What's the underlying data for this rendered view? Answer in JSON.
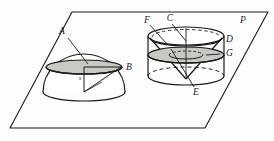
{
  "figure": {
    "plane_label": "P",
    "colors": {
      "stroke": "#1a1a1a",
      "shade_fill": "#c9c9c4",
      "background": "#fdfdfd",
      "dashed": "#1a1a1a"
    },
    "labels": {
      "A": "A",
      "B": "B",
      "C": "C",
      "D": "D",
      "E": "E",
      "F": "F",
      "G": "G",
      "P": "P",
      "hemisphere_center": "s"
    },
    "shapes": {
      "plane": {
        "name": "plane-p",
        "kind": "parallelogram",
        "points": "72,12 268,12 205,128 10,128"
      },
      "hemisphere": {
        "name": "hemisphere-solid",
        "center_x": 84,
        "base_y": 92,
        "radius_x": 41,
        "radius_y": 9,
        "dome_height": 38,
        "section_y": 67,
        "section_radius_x": 38,
        "section_radius_y": 7
      },
      "cylinder": {
        "name": "cylinder-solid",
        "center_x": 186,
        "top_y": 36,
        "bottom_y": 76,
        "radius_x": 38,
        "radius_y": 9,
        "section_y": 55,
        "section_radius_x": 38,
        "section_radius_y": 8,
        "cone_apex_x": 186,
        "cone_apex_y": 79
      }
    },
    "leaders": [
      {
        "name": "leader-a",
        "from": "68,36",
        "to": "87,63"
      },
      {
        "name": "leader-f",
        "from": "150,24",
        "to": "165,42"
      },
      {
        "name": "leader-c",
        "from": "172,22",
        "to": "186,40"
      },
      {
        "name": "leader-d",
        "from": "222,40",
        "to": "214,44"
      },
      {
        "name": "leader-g",
        "from": "222,53",
        "to": "209,55"
      },
      {
        "name": "leader-e",
        "from": "196,86",
        "to": "172,50"
      }
    ]
  }
}
